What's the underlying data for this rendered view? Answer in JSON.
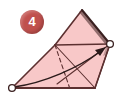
{
  "figure": {
    "kind": "origami-fold-step-diagram",
    "step_badge": {
      "number": "4",
      "shape": "circle",
      "fill_color": "#c0504d",
      "text_color": "#ffffff"
    },
    "paper": {
      "fill_color": "#f8c8c8",
      "edge_color": "#5c3030",
      "shadow_color": "#3a2020",
      "crease_color": "#5c3030",
      "dashed_crease_color": "#5c3030"
    },
    "arrow": {
      "style": "curved-fold-arrow",
      "color": "#2b1a1a",
      "direction": "up-right",
      "from_label": "bottom-left-corner",
      "to_label": "right-corner"
    },
    "markers": [
      {
        "name": "corner-marker-left",
        "x": 12,
        "y": 88,
        "fill": "#ffffff",
        "stroke": "#3a2020"
      },
      {
        "name": "corner-marker-right",
        "x": 110,
        "y": 44,
        "fill": "#ffffff",
        "stroke": "#3a2020"
      }
    ],
    "geometry": {
      "apex": [
        82,
        10
      ],
      "left_mid": [
        55,
        45
      ],
      "right_corner": [
        110,
        44
      ],
      "bottom_left": [
        12,
        88
      ],
      "bottom_right": [
        95,
        88
      ],
      "dashed_fold_end": [
        70,
        89
      ]
    }
  }
}
